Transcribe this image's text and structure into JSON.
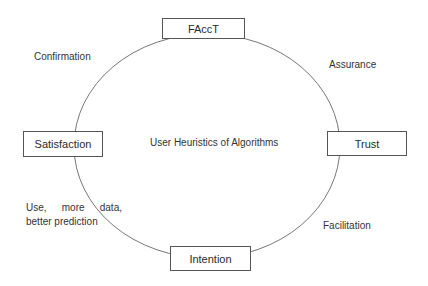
{
  "diagram": {
    "type": "cycle",
    "center_label": "User Heuristics of Algorithms",
    "nodes": [
      {
        "id": "facct",
        "label": "FAccT"
      },
      {
        "id": "trust",
        "label": "Trust"
      },
      {
        "id": "intention",
        "label": "Intention"
      },
      {
        "id": "satisfaction",
        "label": "Satisfaction"
      }
    ],
    "edge_labels": {
      "facct_to_trust": "Assurance",
      "trust_to_intention": "Facilitation",
      "intention_to_satisfaction": {
        "line1": [
          "Use,",
          "more",
          "data,"
        ],
        "line2": "better prediction"
      },
      "satisfaction_to_facct": "Confirmation"
    }
  }
}
